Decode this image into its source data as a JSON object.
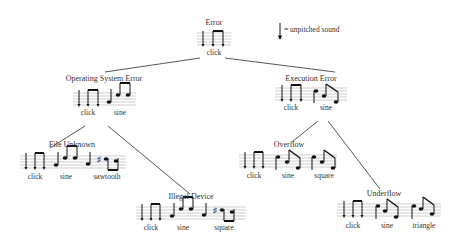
{
  "legend": {
    "icon": "unpitched-note-icon",
    "text": "= unpitched sound"
  },
  "nodes": {
    "error": {
      "title": "Error",
      "labels": [
        "click"
      ]
    },
    "os_error": {
      "title": "Operating System Error",
      "labels": [
        "click",
        "sine"
      ]
    },
    "exec_error": {
      "title": "Execution Error",
      "labels": [
        "click",
        "sine"
      ]
    },
    "file_unknown": {
      "title": "File Unknown",
      "labels": [
        "click",
        "sine",
        "sawtooth"
      ]
    },
    "illegal_device": {
      "title": "Illegal Device",
      "labels": [
        "click",
        "sine",
        "square"
      ]
    },
    "overflow": {
      "title": "Overflow",
      "labels": [
        "click",
        "sine",
        "square"
      ]
    },
    "underflow": {
      "title": "Underflow",
      "labels": [
        "click",
        "sine",
        "triangle"
      ]
    }
  },
  "colors": {
    "line": "#444444",
    "staff": "#888888",
    "note": "#111111"
  }
}
